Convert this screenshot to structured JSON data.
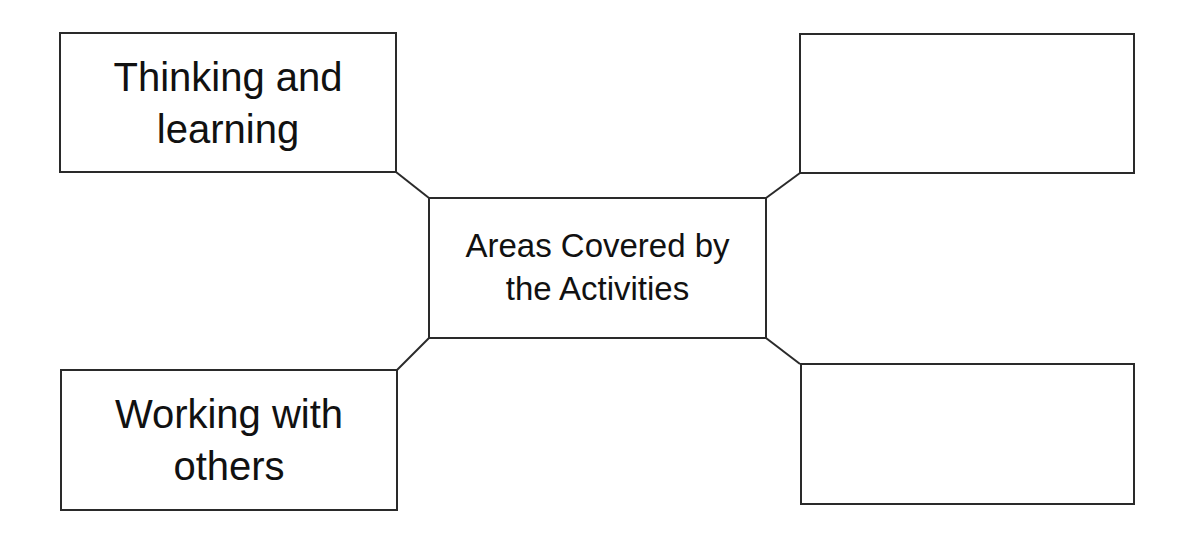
{
  "diagram": {
    "type": "mind-map",
    "center": {
      "label": "Areas Covered by the Activities",
      "lines": [
        "Areas Covered by",
        "the Activities"
      ]
    },
    "nodes": [
      {
        "position": "top-left",
        "label": "Thinking and learning",
        "lines": [
          "Thinking and",
          "learning"
        ]
      },
      {
        "position": "top-right",
        "label": "",
        "lines": []
      },
      {
        "position": "bottom-left",
        "label": "Working with others",
        "lines": [
          "Working with",
          "others"
        ]
      },
      {
        "position": "bottom-right",
        "label": "",
        "lines": []
      }
    ],
    "colors": {
      "stroke": "#2a2a2a",
      "background": "#ffffff",
      "text": "#111111"
    }
  }
}
